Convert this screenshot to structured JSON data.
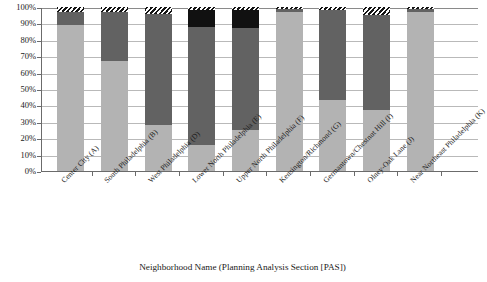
{
  "chart_data": {
    "type": "bar",
    "subtype": "stacked-100-percent",
    "title": "",
    "xlabel": "Neighborhood Name (Planning Analysis Section  [PAS])",
    "ylabel": "",
    "ylim": [
      0,
      100
    ],
    "grid": true,
    "legend_position": "none",
    "ytick_labels": [
      "100%",
      "90%",
      "80%",
      "70%",
      "60%",
      "50%",
      "40%",
      "30%",
      "20%",
      "10%",
      "0%"
    ],
    "ytick_values": [
      100,
      90,
      80,
      70,
      60,
      50,
      40,
      30,
      20,
      10,
      0
    ],
    "categories": [
      "Center City (A)",
      "South Philadelphia (B)",
      "West Philadelphia (D)",
      "Lower North Philadelphia (E)",
      "Upper North Philadelphia (F)",
      "Kensington/Richmond (G)",
      "Germantown/Chestnut Hill (I)",
      "Olney-Oak Lane (J)",
      "Near Northeast Philadelphia (K)"
    ],
    "series": [
      {
        "name": "series-1-light-gray",
        "color": "#b3b3b3",
        "pattern": "solid",
        "values": [
          89,
          67,
          28,
          16,
          25,
          97,
          43,
          37,
          97
        ]
      },
      {
        "name": "series-2-dark-gray",
        "color": "#626262",
        "pattern": "solid",
        "values": [
          8,
          30,
          68,
          72,
          62,
          2,
          55,
          58,
          2
        ]
      },
      {
        "name": "series-3-black",
        "color": "#111111",
        "pattern": "solid",
        "values": [
          0,
          0,
          0,
          10,
          11,
          0,
          0,
          0,
          0
        ]
      },
      {
        "name": "series-4-hatched",
        "color": "#1b1b1b",
        "pattern": "diagonal-hatch",
        "values": [
          3,
          3,
          4,
          2,
          2,
          1,
          2,
          5,
          1
        ]
      }
    ]
  },
  "axis": {
    "x_title": "Neighborhood Name (Planning Analysis Section  [PAS])"
  }
}
